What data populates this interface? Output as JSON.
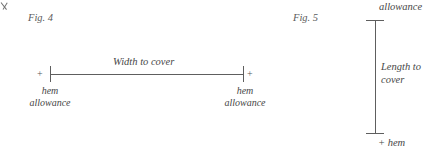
{
  "page": {
    "width": 423,
    "height": 155,
    "background": "#ffffff",
    "ink_color": "#5e5e5e",
    "text_color": "#474747"
  },
  "figures": [
    {
      "id": "fig-4",
      "caption": "Fig. 4",
      "orientation": "horizontal",
      "dimension_label": "Width to cover",
      "left_end": {
        "plus": "+",
        "line1": "hem",
        "line2": "allowance"
      },
      "right_end": {
        "plus": "+",
        "line1": "hem",
        "line2": "allowance"
      }
    },
    {
      "id": "fig-5",
      "caption": "Fig. 5",
      "orientation": "vertical",
      "dimension_label_line1": "Length to",
      "dimension_label_line2": "cover",
      "top_end": {
        "label": "allowance"
      },
      "bottom_end": {
        "label": "+ hem"
      }
    }
  ]
}
